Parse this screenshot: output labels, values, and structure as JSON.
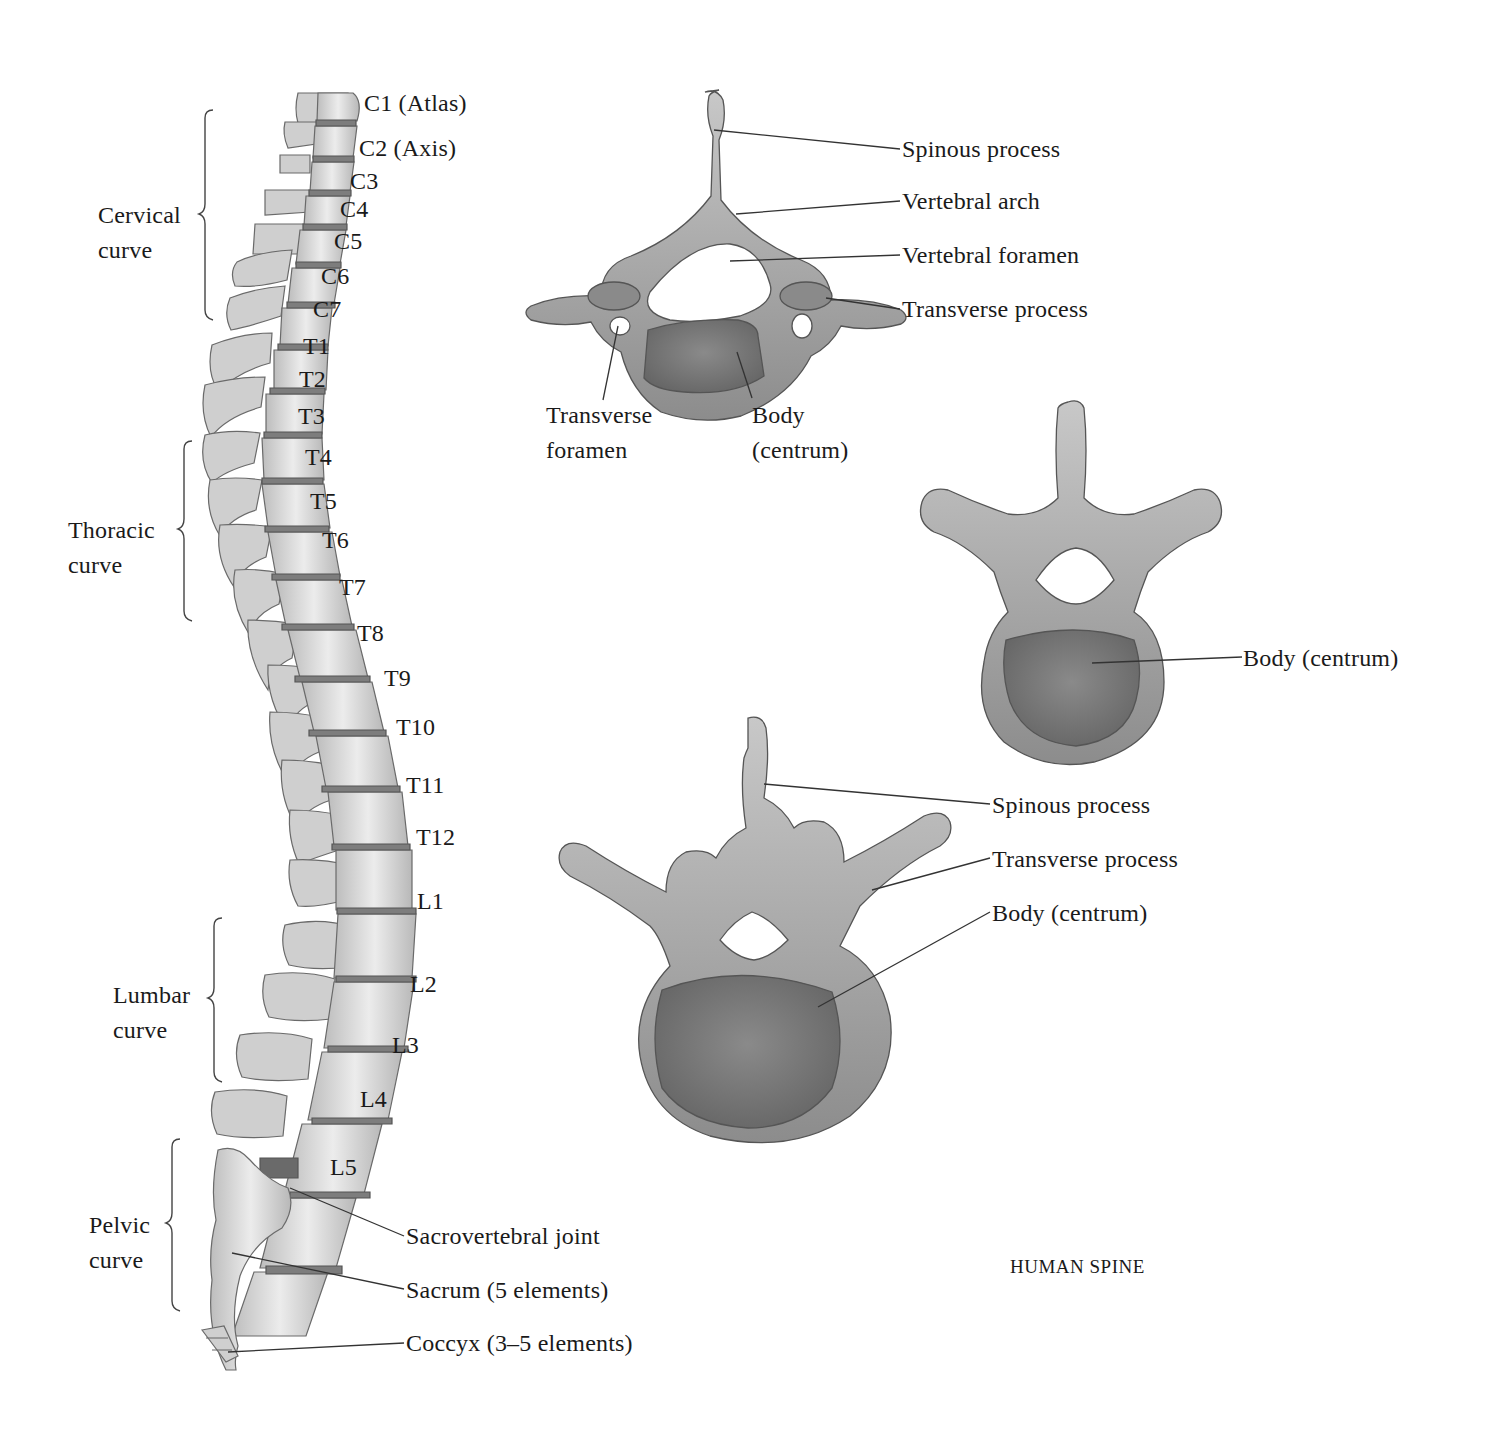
{
  "title": "HUMAN SPINE",
  "colors": {
    "bone_light": "#e8e8e8",
    "bone_mid": "#c9c9c9",
    "bone_dark": "#8f8f8f",
    "centrum_fill": "#7a7a7a",
    "disc": "#6e6e6e",
    "outline": "#555555",
    "leader_line": "#333333",
    "text": "#1a1a1a"
  },
  "spine_lateral": {
    "curves": [
      {
        "line1": "Cervical",
        "line2": "curve"
      },
      {
        "line1": "Thoracic",
        "line2": "curve"
      },
      {
        "line1": "Lumbar",
        "line2": "curve"
      },
      {
        "line1": "Pelvic",
        "line2": "curve"
      }
    ],
    "vertebrae": [
      "C1 (Atlas)",
      "C2 (Axis)",
      "C3",
      "C4",
      "C5",
      "C6",
      "C7",
      "T1",
      "T2",
      "T3",
      "T4",
      "T5",
      "T6",
      "T7",
      "T8",
      "T9",
      "T10",
      "T11",
      "T12",
      "L1",
      "L2",
      "L3",
      "L4",
      "L5"
    ],
    "lower_labels": [
      "Sacrovertebral joint",
      "Sacrum (5 elements)",
      "Coccyx (3–5 elements)"
    ]
  },
  "cervical_vertebra": {
    "labels": [
      "Spinous process",
      "Vertebral arch",
      "Vertebral foramen",
      "Transverse process"
    ],
    "bottom_labels": [
      {
        "line1": "Transverse",
        "line2": "foramen"
      },
      {
        "line1": "Body",
        "line2": "(centrum)"
      }
    ]
  },
  "thoracic_vertebra": {
    "labels": [
      "Body (centrum)"
    ]
  },
  "lumbar_vertebra": {
    "labels": [
      "Spinous process",
      "Transverse process",
      "Body (centrum)"
    ]
  }
}
